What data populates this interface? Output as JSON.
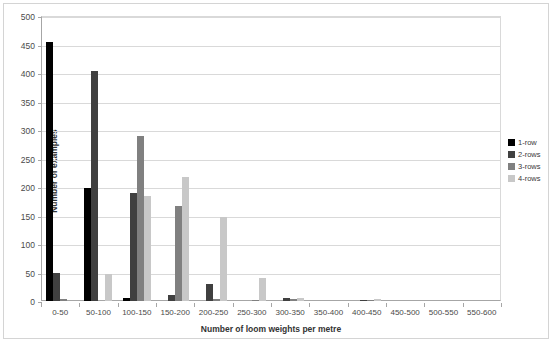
{
  "chart_data": {
    "type": "bar",
    "title": "",
    "xlabel": "Number of loom weights per metre",
    "ylabel": "Number of examples",
    "ylim": [
      0,
      500
    ],
    "ytick_step": 50,
    "yticks": [
      500,
      450,
      400,
      350,
      300,
      250,
      200,
      150,
      100,
      50,
      0
    ],
    "grid": true,
    "legend_position": "right",
    "categories": [
      "0-50",
      "50-100",
      "100-150",
      "150-200",
      "200-250",
      "250-300",
      "300-350",
      "350-400",
      "400-450",
      "450-500",
      "500-550",
      "550-600"
    ],
    "series": [
      {
        "name": "1-row",
        "color": "#000000",
        "values": [
          455,
          198,
          5,
          0,
          0,
          0,
          0,
          0,
          0,
          0,
          0,
          0
        ]
      },
      {
        "name": "2-rows",
        "color": "#404040",
        "values": [
          50,
          404,
          190,
          10,
          30,
          0,
          5,
          0,
          2,
          0,
          0,
          0
        ]
      },
      {
        "name": "3-rows",
        "color": "#808080",
        "values": [
          4,
          0,
          290,
          167,
          3,
          1,
          3,
          0,
          2,
          0,
          0,
          0
        ]
      },
      {
        "name": "4-rows",
        "color": "#c8c8c8",
        "values": [
          0,
          47,
          185,
          218,
          148,
          40,
          5,
          0,
          3,
          0,
          0,
          0
        ]
      }
    ]
  }
}
